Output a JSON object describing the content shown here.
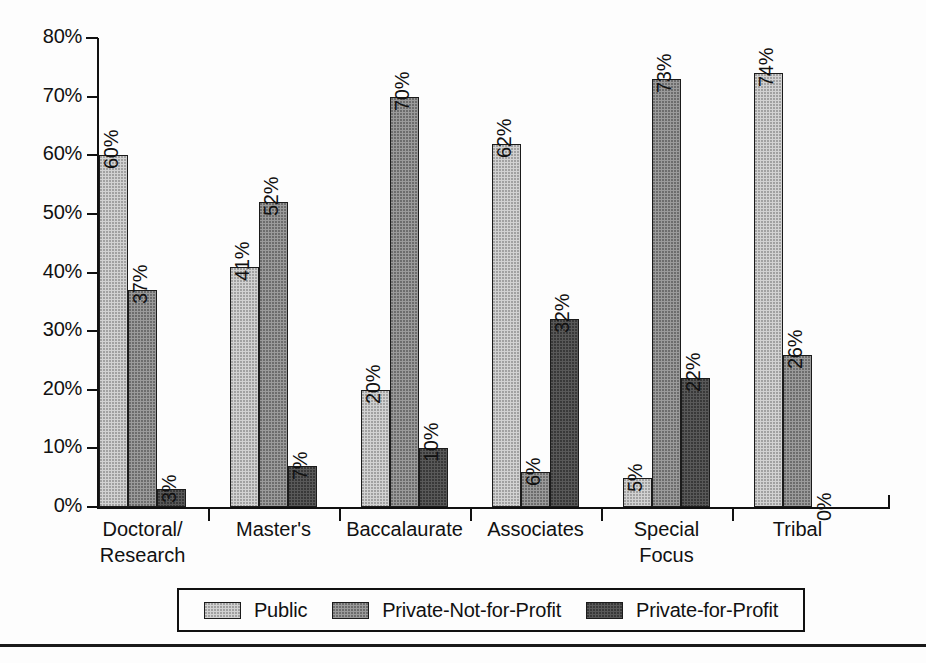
{
  "chart_data": {
    "type": "bar",
    "title": "",
    "subtitle": "",
    "xlabel": "",
    "ylabel": "",
    "ylim": [
      0,
      80
    ],
    "grid": false,
    "legend_position": "bottom",
    "orientation": "vertical",
    "grouping": "grouped",
    "value_label_rotation": "vertical",
    "categories": [
      "Doctoral/\nResearch",
      "Master's",
      "Baccalaurate",
      "Associates",
      "Special\nFocus",
      "Tribal"
    ],
    "ytick_labels": [
      "0%",
      "10%",
      "20%",
      "30%",
      "40%",
      "50%",
      "60%",
      "70%",
      "80%"
    ],
    "ytick_values": [
      0,
      10,
      20,
      30,
      40,
      50,
      60,
      70,
      80
    ],
    "series": [
      {
        "name": "Public",
        "color": "#d2d2d2",
        "values": [
          60,
          41,
          20,
          62,
          5,
          74
        ],
        "labels": [
          "60%",
          "41%",
          "20%",
          "62%",
          "5%",
          "74%"
        ]
      },
      {
        "name": "Private-Not-for-Profit",
        "color": "#9b9b9b",
        "values": [
          37,
          52,
          70,
          6,
          73,
          26
        ],
        "labels": [
          "37%",
          "52%",
          "70%",
          "6%",
          "73%",
          "26%"
        ]
      },
      {
        "name": "Private-for-Profit",
        "color": "#595959",
        "values": [
          3,
          7,
          10,
          32,
          22,
          0
        ],
        "labels": [
          "3%",
          "7%",
          "10%",
          "32%",
          "22%",
          "0%"
        ]
      }
    ]
  },
  "legend": {
    "items": [
      {
        "label": "Public",
        "swatch": "legend-swatch-public"
      },
      {
        "label": "Private-Not-for-Profit",
        "swatch": "legend-swatch-private-not-for-profit"
      },
      {
        "label": "Private-for-Profit",
        "swatch": "legend-swatch-private-for-profit"
      }
    ]
  },
  "colors": {
    "axis": "#111111",
    "bar_outline": "#1b1b1b",
    "public": "#d2d2d2",
    "private_not_for_profit": "#9b9b9b",
    "private_for_profit": "#595959",
    "page_rule": "#1a1a1a",
    "background": "#fdfdfd"
  }
}
